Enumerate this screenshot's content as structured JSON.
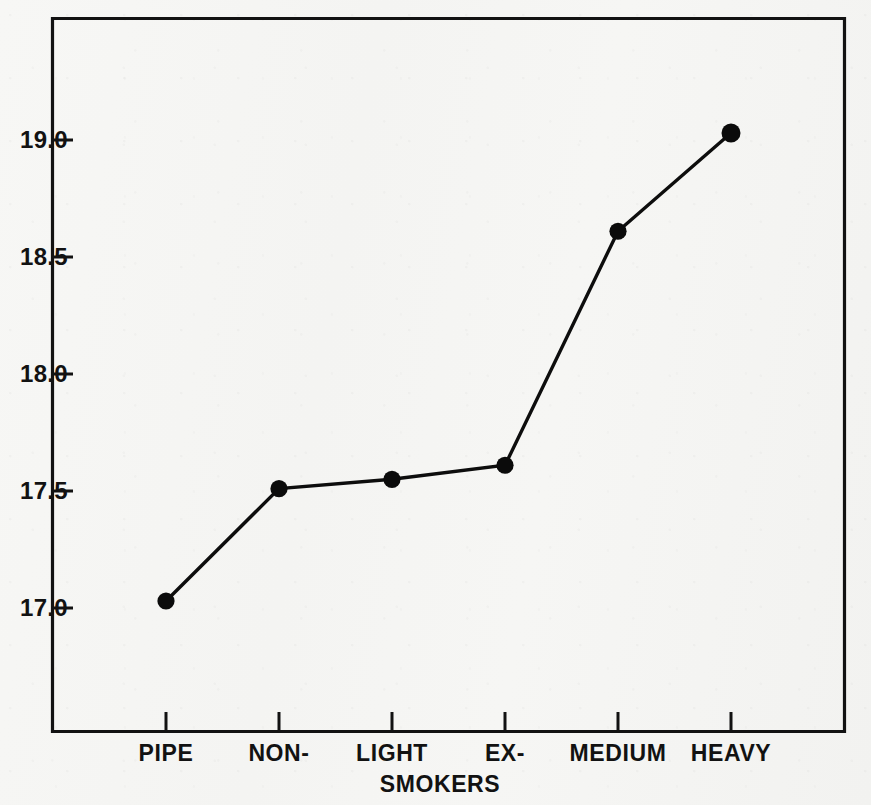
{
  "chart_data": {
    "type": "line",
    "title": "",
    "xlabel": "SMOKERS",
    "ylabel": "",
    "categories": [
      "PIPE",
      "NON-",
      "LIGHT",
      "EX-",
      "MEDIUM",
      "HEAVY"
    ],
    "values": [
      17.03,
      17.51,
      17.55,
      17.61,
      18.61,
      19.03
    ],
    "series": [
      {
        "name": "",
        "values": [
          17.03,
          17.51,
          17.55,
          17.61,
          18.61,
          19.03
        ]
      }
    ],
    "ylim": [
      16.6,
      19.6
    ],
    "ytick_labels": [
      "17.0",
      "17.5",
      "18.0",
      "18.5",
      "19.0"
    ],
    "ytick_values": [
      17.0,
      17.5,
      18.0,
      18.5,
      19.0
    ],
    "xtick_labels": [
      "PIPE",
      "NON-",
      "LIGHT",
      "EX-",
      "MEDIUM",
      "HEAVY"
    ],
    "grid": false,
    "legend": false,
    "marker": "filled-circle",
    "line_color": "#0d0d0d",
    "marker_color": "#0b0b0b",
    "axis_color": "#121212",
    "background_color": "#f5f5f3"
  },
  "axes": {
    "y_ticks": [
      {
        "label": "19.0",
        "value": 19.0
      },
      {
        "label": "18.5",
        "value": 18.5
      },
      {
        "label": "18.0",
        "value": 18.0
      },
      {
        "label": "17.5",
        "value": 17.5
      },
      {
        "label": "17.0",
        "value": 17.0
      }
    ],
    "x_ticks": [
      {
        "label": "PIPE",
        "value": 17.03
      },
      {
        "label": "NON-",
        "value": 17.51
      },
      {
        "label": "LIGHT",
        "value": 17.55
      },
      {
        "label": "EX-",
        "value": 17.61
      },
      {
        "label": "MEDIUM",
        "value": 18.61
      },
      {
        "label": "HEAVY",
        "value": 19.03
      }
    ],
    "x_axis_title": "SMOKERS"
  }
}
